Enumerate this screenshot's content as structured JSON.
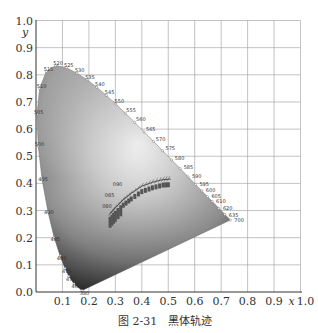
{
  "chart_data": {
    "type": "scatter",
    "title": "",
    "caption_number": "图 2-31",
    "caption_text": "黑体轨迹",
    "xlabel": "x",
    "ylabel": "y",
    "xlim": [
      0.0,
      1.0
    ],
    "ylim": [
      0.0,
      1.0
    ],
    "grid": true,
    "x_ticks": [
      "0.1",
      "0.2",
      "0.3",
      "0.4",
      "0.5",
      "0.6",
      "0.7",
      "0.8",
      "0.9",
      "1.0"
    ],
    "y_ticks": [
      "0.0",
      "0.1",
      "0.2",
      "0.3",
      "0.4",
      "0.5",
      "0.6",
      "0.7",
      "0.8",
      "0.9",
      "1.0"
    ],
    "spectral_locus": [
      {
        "nm": "380",
        "x": 0.1741,
        "y": 0.005
      },
      {
        "nm": "460",
        "x": 0.144,
        "y": 0.0297
      },
      {
        "nm": "470",
        "x": 0.1241,
        "y": 0.0578
      },
      {
        "nm": "475",
        "x": 0.1096,
        "y": 0.0868
      },
      {
        "nm": "480",
        "x": 0.0913,
        "y": 0.1327
      },
      {
        "nm": "485",
        "x": 0.0687,
        "y": 0.2007
      },
      {
        "nm": "490",
        "x": 0.0454,
        "y": 0.295
      },
      {
        "nm": "495",
        "x": 0.0235,
        "y": 0.4127
      },
      {
        "nm": "500",
        "x": 0.0082,
        "y": 0.5384
      },
      {
        "nm": "505",
        "x": 0.0039,
        "y": 0.6548
      },
      {
        "nm": "510",
        "x": 0.0139,
        "y": 0.7502
      },
      {
        "nm": "515",
        "x": 0.0389,
        "y": 0.812
      },
      {
        "nm": "520",
        "x": 0.0743,
        "y": 0.8338
      },
      {
        "nm": "525",
        "x": 0.1142,
        "y": 0.8262
      },
      {
        "nm": "530",
        "x": 0.1547,
        "y": 0.8059
      },
      {
        "nm": "535",
        "x": 0.1929,
        "y": 0.7816
      },
      {
        "nm": "540",
        "x": 0.2296,
        "y": 0.7543
      },
      {
        "nm": "545",
        "x": 0.2658,
        "y": 0.7243
      },
      {
        "nm": "550",
        "x": 0.3016,
        "y": 0.6923
      },
      {
        "nm": "555",
        "x": 0.3373,
        "y": 0.6589
      },
      {
        "nm": "560",
        "x": 0.3731,
        "y": 0.6245
      },
      {
        "nm": "565",
        "x": 0.4087,
        "y": 0.5896
      },
      {
        "nm": "570",
        "x": 0.4441,
        "y": 0.5547
      },
      {
        "nm": "575",
        "x": 0.4788,
        "y": 0.5202
      },
      {
        "nm": "580",
        "x": 0.5125,
        "y": 0.4866
      },
      {
        "nm": "585",
        "x": 0.5448,
        "y": 0.4544
      },
      {
        "nm": "590",
        "x": 0.5752,
        "y": 0.4242
      },
      {
        "nm": "595",
        "x": 0.6029,
        "y": 0.3965
      },
      {
        "nm": "600",
        "x": 0.627,
        "y": 0.3725
      },
      {
        "nm": "605",
        "x": 0.6482,
        "y": 0.3514
      },
      {
        "nm": "610",
        "x": 0.6658,
        "y": 0.334
      },
      {
        "nm": "620",
        "x": 0.6915,
        "y": 0.3083
      },
      {
        "nm": "635",
        "x": 0.714,
        "y": 0.2859
      },
      {
        "nm": "700",
        "x": 0.7347,
        "y": 0.2653
      }
    ],
    "planckian_locus_labels": [
      "090",
      "085",
      "080"
    ],
    "planckian_locus": [
      {
        "x": 0.28,
        "y": 0.288
      },
      {
        "x": 0.3,
        "y": 0.31
      },
      {
        "x": 0.33,
        "y": 0.34
      },
      {
        "x": 0.36,
        "y": 0.363
      },
      {
        "x": 0.4,
        "y": 0.39
      },
      {
        "x": 0.44,
        "y": 0.404
      },
      {
        "x": 0.48,
        "y": 0.414
      },
      {
        "x": 0.51,
        "y": 0.416
      }
    ]
  }
}
